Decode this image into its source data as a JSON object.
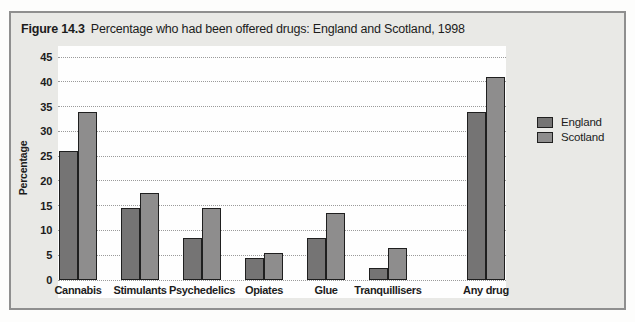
{
  "figure": {
    "label": "Figure 14.3",
    "title": "Percentage who had been offered drugs: England and Scotland, 1998"
  },
  "chart_data": {
    "type": "bar",
    "title": "Percentage who had been offered drugs: England and Scotland, 1998",
    "categories": [
      "Cannabis",
      "Stimulants",
      "Psychedelics",
      "Opiates",
      "Glue",
      "Tranquillisers",
      "Any drug"
    ],
    "series": [
      {
        "name": "England",
        "color": "#757474",
        "values": [
          26,
          14.5,
          8.5,
          4.5,
          8.5,
          2.5,
          34
        ]
      },
      {
        "name": "Scotland",
        "color": "#8e8d8d",
        "values": [
          34,
          17.5,
          14.5,
          5.5,
          13.5,
          6.5,
          41
        ]
      }
    ],
    "xlabel": "",
    "ylabel": "Percentage",
    "ylim": [
      0,
      45
    ],
    "ytick_step": 5,
    "grid": "horizontal-dotted",
    "legend_position": "right"
  }
}
